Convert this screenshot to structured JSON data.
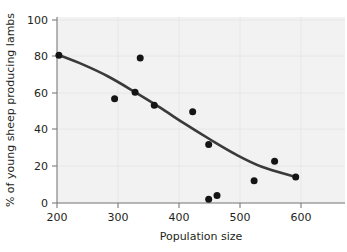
{
  "chart_data": {
    "type": "scatter",
    "title": "",
    "xlabel": "Population size",
    "ylabel": "% of young sheep producing lambs",
    "xlim": [
      200,
      650
    ],
    "ylim": [
      0,
      100
    ],
    "xticks": [
      200,
      300,
      400,
      500,
      600
    ],
    "yticks": [
      0,
      20,
      40,
      60,
      80,
      100
    ],
    "xtick_labels": [
      "200",
      "300",
      "400",
      "500",
      "600"
    ],
    "ytick_labels": [
      "0",
      "20",
      "40",
      "60",
      "80",
      "100"
    ],
    "grid": true,
    "legend": "none",
    "point_color": "#151515",
    "curve_color": "#3a3a3a",
    "plot_background": "#f2f2f2",
    "points": [
      {
        "x": 203,
        "y": 79.5
      },
      {
        "x": 290,
        "y": 56.0
      },
      {
        "x": 322,
        "y": 59.5
      },
      {
        "x": 330,
        "y": 78.0
      },
      {
        "x": 352,
        "y": 52.5
      },
      {
        "x": 412,
        "y": 49.0
      },
      {
        "x": 437,
        "y": 31.5
      },
      {
        "x": 437,
        "y": 2.0
      },
      {
        "x": 450,
        "y": 4.0
      },
      {
        "x": 508,
        "y": 12.0
      },
      {
        "x": 540,
        "y": 22.5
      },
      {
        "x": 573,
        "y": 14.0
      }
    ],
    "series": [
      {
        "name": "observations",
        "x": [
          203,
          290,
          322,
          330,
          352,
          412,
          437,
          437,
          450,
          508,
          540,
          573
        ],
        "values": [
          79.5,
          56.0,
          59.5,
          78.0,
          52.5,
          49.0,
          31.5,
          2.0,
          4.0,
          12.0,
          22.5,
          14.0
        ]
      },
      {
        "name": "fitted-trend",
        "x": [
          203,
          240,
          280,
          320,
          360,
          400,
          440,
          480,
          520,
          573
        ],
        "values": [
          79.5,
          74.5,
          68.0,
          60.0,
          51.5,
          42.5,
          34.0,
          26.0,
          19.5,
          14.0
        ]
      }
    ],
    "annotations": []
  }
}
